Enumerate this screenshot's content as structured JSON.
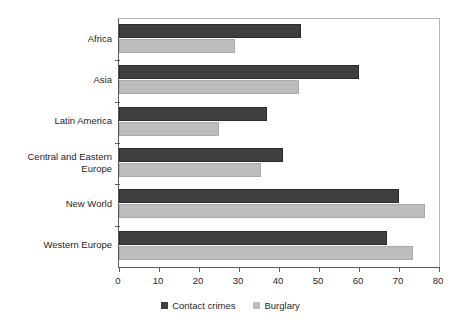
{
  "chart_data": {
    "type": "bar",
    "orientation": "horizontal",
    "title": "",
    "subtitle": "",
    "xlabel": "",
    "ylabel": "",
    "xlim": [
      0,
      80
    ],
    "xticks": [
      0,
      10,
      20,
      30,
      40,
      50,
      60,
      70,
      80
    ],
    "xtick_labels": [
      "0",
      "10",
      "20",
      "30",
      "40",
      "50",
      "60",
      "70",
      "80"
    ],
    "grid": false,
    "legend_position": "bottom",
    "categories": [
      "Africa",
      "Asia",
      "Latin America",
      "Central and Eastern Europe",
      "New World",
      "Western Europe"
    ],
    "series": [
      {
        "name": "Contact crimes",
        "color": "#3f3f3f",
        "values": [
          45.5,
          60,
          37,
          41,
          70,
          67
        ]
      },
      {
        "name": "Burglary",
        "color": "#bdbdbd",
        "values": [
          29,
          45,
          25,
          35.5,
          76.5,
          73.5
        ]
      }
    ]
  },
  "legend": {
    "items": [
      {
        "label": "Contact crimes",
        "swatch": "dark-gray-swatch-icon"
      },
      {
        "label": "Burglary",
        "swatch": "light-gray-swatch-icon"
      }
    ]
  }
}
